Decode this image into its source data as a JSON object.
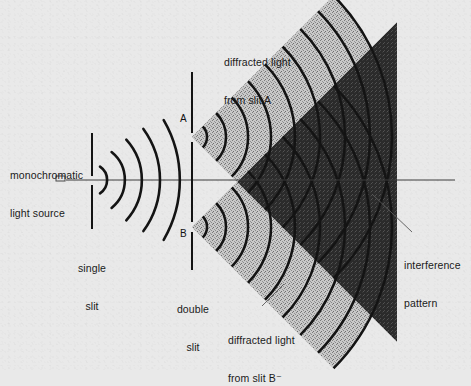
{
  "figure": {
    "background_color": "#e9e9e9",
    "ink_color": "#111111",
    "wave_band_light": "#b8b8b8",
    "wave_band_dark": "#2b2b2b"
  },
  "labels": {
    "source": "monochromatic\nlight source",
    "source_line1": "monochromatic",
    "source_line2": "light source",
    "single_slit": "single\nslit",
    "single_slit_line1": "single",
    "single_slit_line2": "slit",
    "double_slit": "double\nslit",
    "double_slit_line1": "double",
    "double_slit_line2": "slit",
    "diffracted_a": "diffracted light\nfrom slit A",
    "diffracted_a_line1": "diffracted light",
    "diffracted_a_line2": "from slit A",
    "diffracted_b": "diffracted light\nfrom slit B⁻",
    "diffracted_b_line1": "diffracted light",
    "diffracted_b_line2": "from slit B⁻",
    "interference": "interference\npattern",
    "interference_line1": "interference",
    "interference_line2": "pattern",
    "slit_a": "A",
    "slit_b": "B"
  },
  "geometry": {
    "axis_y": 180,
    "source_x": 60,
    "single_slit_x": 92,
    "double_slit_x": 192,
    "slit_a_y": 137,
    "slit_b_y": 227,
    "fan_radius_max": 205,
    "incident_arc_count": 5,
    "diffracted_arc_count": 8
  }
}
